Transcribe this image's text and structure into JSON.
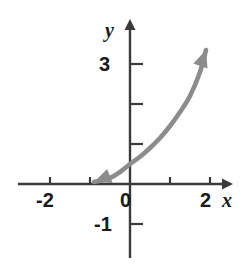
{
  "figure": {
    "background_color": "#fefefe",
    "axis_color": "#3a3a3a",
    "curve_color": "#8c8c8c",
    "text_color": "#1a1a1a"
  },
  "axes": {
    "x_name": "x",
    "y_name": "y",
    "x_tick_labels": [
      "-2",
      "0",
      "2"
    ],
    "y_tick_labels": [
      "3",
      "-1"
    ]
  },
  "labels": {
    "x_neg2": "-2",
    "x_0": "0",
    "x_2": "2",
    "y_3": "3",
    "y_neg1": "-1",
    "axis_x": "x",
    "axis_y": "y"
  },
  "chart_data": {
    "type": "line",
    "title": "",
    "xlabel": "x",
    "ylabel": "y",
    "xlim": [
      -2.75,
      2.4
    ],
    "ylim": [
      -1.35,
      3.75
    ],
    "grid": false,
    "legend": null,
    "x_ticks": [
      -2,
      -1,
      0,
      1,
      2
    ],
    "x_tick_labels": [
      "-2",
      "",
      "0",
      "",
      "2"
    ],
    "y_ticks": [
      -1,
      1,
      2,
      3
    ],
    "y_tick_labels": [
      "-1",
      "",
      "",
      "3"
    ],
    "axis_arrows": {
      "x_positive": true,
      "y_positive": true
    },
    "series": [
      {
        "name": "exponential curve",
        "description": "increasing exponential-type curve with arrowheads at both ends",
        "arrow_start": true,
        "arrow_end": true,
        "x": [
          -0.9,
          -0.5,
          -0.25,
          0.0,
          0.25,
          0.5,
          0.75,
          1.0,
          1.25,
          1.5,
          1.75,
          1.9
        ],
        "y": [
          0.05,
          0.15,
          0.3,
          0.5,
          0.68,
          0.9,
          1.15,
          1.45,
          1.8,
          2.2,
          2.8,
          3.35
        ]
      }
    ]
  }
}
